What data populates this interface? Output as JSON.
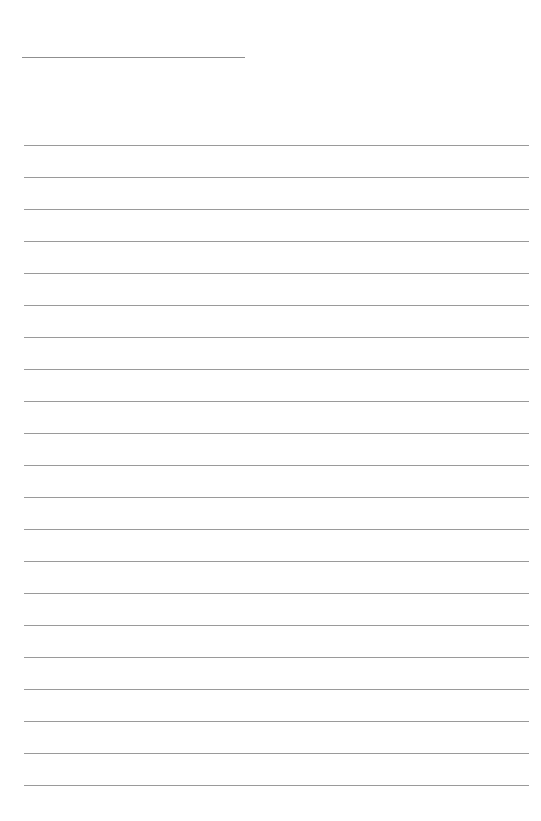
{
  "page": {
    "type": "lined-paper",
    "background_color": "#ffffff",
    "line_color": "#9a9a9a"
  },
  "header_line": {
    "x": 22,
    "y": 57,
    "width": 223
  },
  "ruled_lines": {
    "count": 21,
    "start_y": 145,
    "spacing": 32,
    "x": 24,
    "width": 505
  }
}
